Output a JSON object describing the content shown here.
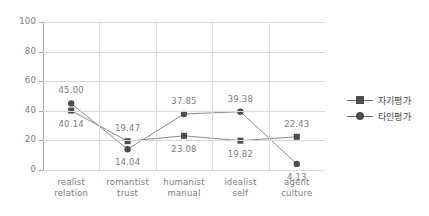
{
  "chart_data": {
    "type": "line",
    "title": "",
    "xlabel": "",
    "ylabel": "",
    "ylim": [
      0,
      100
    ],
    "yticks": [
      0,
      20,
      40,
      60,
      80,
      100
    ],
    "grid": true,
    "legend_position": "right",
    "categories": [
      "realist\nrelation",
      "romantist\ntrust",
      "humanist\nmanual",
      "idealist\nself",
      "agent\nculture"
    ],
    "category_lines": [
      [
        "realist",
        "relation"
      ],
      [
        "romantist",
        "trust"
      ],
      [
        "humanist",
        "manual"
      ],
      [
        "idealist",
        "self"
      ],
      [
        "agent",
        "culture"
      ]
    ],
    "series": [
      {
        "name": "자기평가",
        "marker": "square",
        "color": "#4d4d4d",
        "values": [
          40.14,
          19.47,
          23.08,
          19.82,
          22.43
        ],
        "labels": [
          "40.14",
          "19.47",
          "23.08",
          "19.82",
          "22.43"
        ],
        "label_positions": [
          "below",
          "above",
          "below",
          "below",
          "above"
        ]
      },
      {
        "name": "타인평가",
        "marker": "circle",
        "color": "#4d4d4d",
        "values": [
          45.0,
          14.04,
          37.85,
          39.38,
          4.13
        ],
        "labels": [
          "45.00",
          "14.04",
          "37.85",
          "39.38",
          "4.13"
        ],
        "label_positions": [
          "above",
          "below",
          "above",
          "above",
          "below"
        ]
      }
    ]
  },
  "axis": {
    "ytick_labels": [
      "0",
      "20",
      "40",
      "60",
      "80",
      "100"
    ]
  },
  "legend": {
    "items": [
      {
        "label": "자기평가",
        "marker": "square-marker"
      },
      {
        "label": "타인평가",
        "marker": "circle-marker"
      }
    ]
  }
}
